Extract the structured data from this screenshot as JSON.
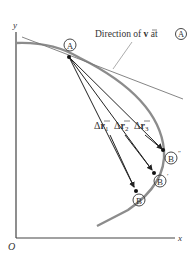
{
  "diagram": {
    "axes": {
      "y_label": "y",
      "x_label": "x",
      "origin_label": "O"
    },
    "annotation": {
      "prefix": "Direction of ",
      "vector": "v",
      "suffix": " at ",
      "point": "A"
    },
    "points": {
      "A": "A",
      "B": "B",
      "B_prime": "B",
      "B_prime_mark": "′",
      "B_dprime": "B",
      "B_dprime_mark": "″"
    },
    "displacements": [
      {
        "delta": "Δ",
        "vector": "r",
        "sub": "1"
      },
      {
        "delta": "Δ",
        "vector": "r",
        "sub": "2"
      },
      {
        "delta": "Δ",
        "vector": "r",
        "sub": "3"
      }
    ],
    "colors": {
      "curve": "#8c8c8c",
      "axis": "#444444",
      "arrow": "#222222",
      "tangent": "#777777"
    }
  }
}
